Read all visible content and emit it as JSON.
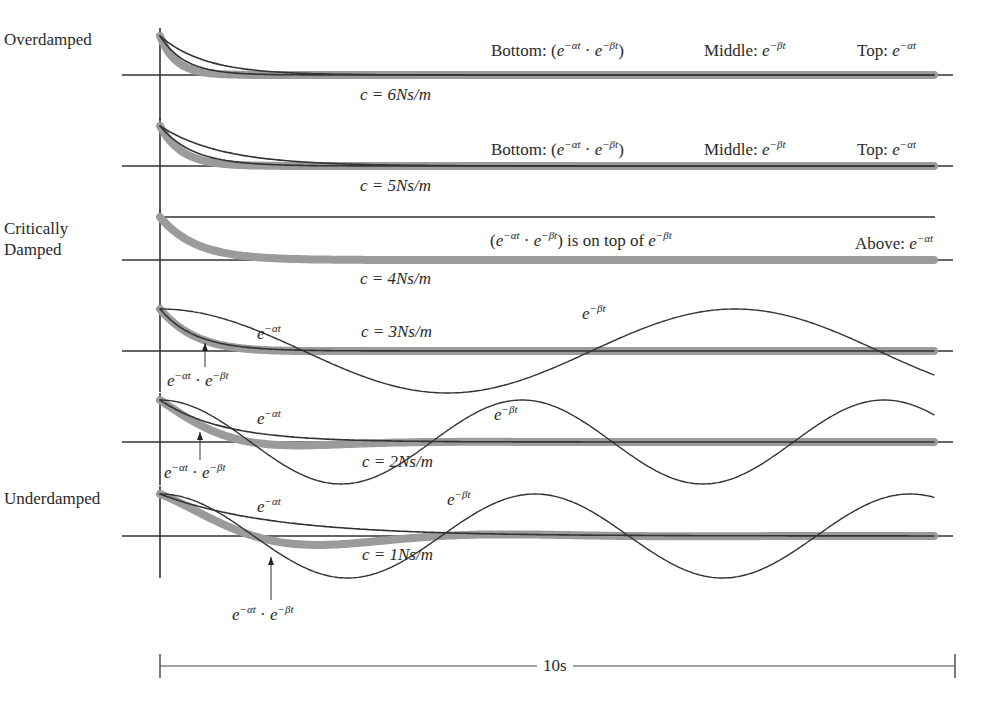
{
  "figure": {
    "time_span_label": "10s",
    "regimes": {
      "overdamped": "Overdamped",
      "critically_line1": "Critically",
      "critically_line2": "Damped",
      "underdamped": "Underdamped"
    },
    "panels": [
      {
        "c_label": "c = 6Ns/m",
        "bottom": "Bottom: (",
        "middle": "Middle: ",
        "top": "Top: "
      },
      {
        "c_label": "c = 5Ns/m",
        "bottom": "Bottom: (",
        "middle": "Middle: ",
        "top": "Top: "
      },
      {
        "c_label": "c = 4Ns/m",
        "note_tail": ") is on top of ",
        "above": "Above: "
      },
      {
        "c_label": "c = 3Ns/m",
        "alpha_label": "e",
        "beta_label": "e",
        "product_label": "e"
      },
      {
        "c_label": "c = 2Ns/m",
        "alpha_label": "e",
        "beta_label": "e",
        "product_label": "e"
      },
      {
        "c_label": "c = 1Ns/m",
        "alpha_label": "e",
        "beta_label": "e",
        "product_label": "e"
      }
    ],
    "exp_alpha": "−αt",
    "exp_beta": "−βt",
    "e": "e",
    "dot": " · "
  },
  "chart_data": {
    "type": "line",
    "title": "",
    "xlabel": "10s",
    "ylabel": "",
    "x_range_s": [
      0,
      10
    ],
    "panels": [
      {
        "regime": "Overdamped",
        "c": 6,
        "series": [
          "e^(−αt) (Top)",
          "e^(−βt) (Middle)",
          "e^(−αt)·e^(−βt) (Bottom)"
        ],
        "note": "Bottom: (e^−αt · e^−βt)  Middle: e^−βt  Top: e^−αt"
      },
      {
        "regime": "Overdamped",
        "c": 5,
        "series": [
          "e^(−αt) (Top)",
          "e^(−βt) (Middle)",
          "e^(−αt)·e^(−βt) (Bottom)"
        ],
        "note": "Bottom: (e^−αt · e^−βt)  Middle: e^−βt  Top: e^−αt"
      },
      {
        "regime": "Critically Damped",
        "c": 4,
        "series": [
          "e^(−αt) (Above, constant)",
          "e^(−αt)·e^(−βt) = e^(−βt)"
        ],
        "note": "(e^−αt · e^−βt) is on top of e^−βt   Above: e^−αt"
      },
      {
        "regime": "Underdamped",
        "c": 3,
        "series": [
          "e^(−αt)",
          "e^(−βt) (oscillatory)",
          "e^(−αt)·e^(−βt)"
        ],
        "approx_period_s": 7.2
      },
      {
        "regime": "Underdamped",
        "c": 2,
        "series": [
          "e^(−αt)",
          "e^(−βt) (oscillatory)",
          "e^(−αt)·e^(−βt)"
        ],
        "approx_period_s": 4.5
      },
      {
        "regime": "Underdamped",
        "c": 1,
        "series": [
          "e^(−αt)",
          "e^(−βt) (oscillatory)",
          "e^(−αt)·e^(−βt)"
        ],
        "approx_period_s": 4.7
      }
    ],
    "legend_position": "inline",
    "grid": false
  }
}
